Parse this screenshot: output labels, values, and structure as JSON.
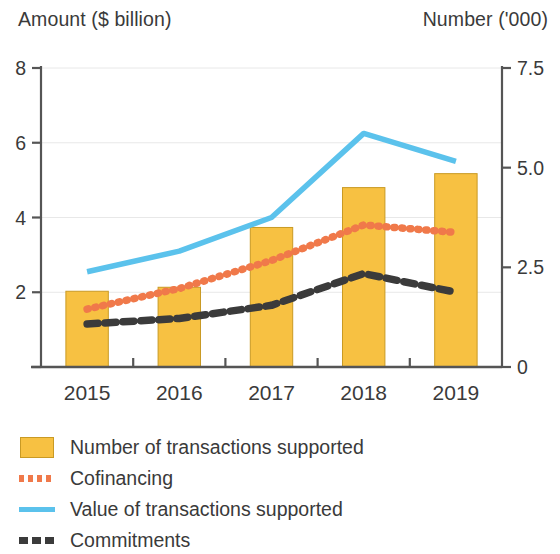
{
  "axes": {
    "left_title": "Amount ($ billion)",
    "right_title": "Number ('000)"
  },
  "chart_data": {
    "type": "bar",
    "title": "",
    "subtitle": "",
    "xlabel": "",
    "ylabel": "Amount ($ billion)",
    "y2label": "Number ('000)",
    "grid": true,
    "legend_position": "bottom-left",
    "categories": [
      "2015",
      "2016",
      "2017",
      "2018",
      "2019"
    ],
    "x_tick_labels": [
      "2015",
      "2016",
      "2017",
      "2018",
      "2019"
    ],
    "ylim": [
      0,
      8
    ],
    "y_tick_labels": [
      "8",
      "6",
      "4",
      "2",
      ""
    ],
    "y_tick_values": [
      8,
      6,
      4,
      2,
      0
    ],
    "y2lim": [
      0,
      7.5
    ],
    "y2_tick_labels": [
      "7.5",
      "5.0",
      "2.5",
      "0"
    ],
    "y2_tick_values": [
      7.5,
      5.0,
      2.5,
      0
    ],
    "series": [
      {
        "name": "Number of transactions supported",
        "kind": "bar",
        "axis": "right",
        "color": "#F7C142",
        "values": [
          1.9,
          2.0,
          3.5,
          4.5,
          4.85
        ]
      },
      {
        "name": "Cofinancing",
        "kind": "dotted-line",
        "axis": "left",
        "color": "#F0794A",
        "values": [
          1.55,
          2.1,
          2.85,
          3.8,
          3.6
        ]
      },
      {
        "name": "Value of transactions supported",
        "kind": "line",
        "axis": "left",
        "color": "#5BC2EC",
        "values": [
          2.55,
          3.1,
          4.0,
          6.25,
          5.5
        ]
      },
      {
        "name": "Commitments",
        "kind": "dashed-line",
        "axis": "left",
        "color": "#3b3b3b",
        "values": [
          1.15,
          1.3,
          1.65,
          2.5,
          2.0
        ]
      }
    ]
  },
  "legend": {
    "items": [
      {
        "label": "Number of transactions supported",
        "key": "bar-swatch",
        "color": "#F7C142"
      },
      {
        "label": "Cofinancing",
        "key": "dotted-line-swatch",
        "color": "#F0794A"
      },
      {
        "label": "Value of transactions supported",
        "key": "solid-line-swatch",
        "color": "#5BC2EC"
      },
      {
        "label": "Commitments",
        "key": "dashed-line-swatch",
        "color": "#3b3b3b"
      }
    ]
  },
  "colors": {
    "bar_fill": "#F7C142",
    "bar_stroke": "#c99a24",
    "cofinancing": "#F0794A",
    "value_line": "#5BC2EC",
    "commitments": "#3b3b3b",
    "axis": "#555555",
    "grid": "#e8e8e8",
    "text": "#3a3a3a"
  }
}
